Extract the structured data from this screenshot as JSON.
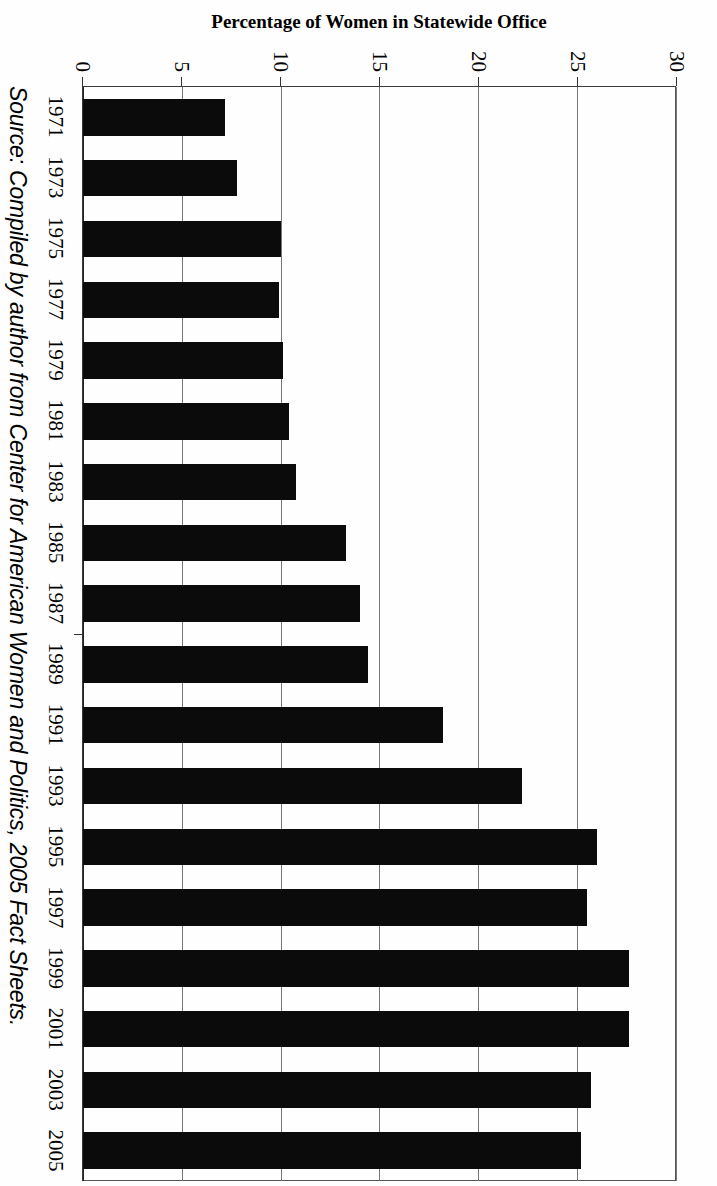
{
  "chart_data": {
    "type": "bar",
    "orientation": "vertical",
    "title": "",
    "xlabel": "",
    "ylabel": "Percentage of Women in Statewide Office",
    "ylim": [
      0,
      30
    ],
    "yticks": [
      0,
      5,
      10,
      15,
      20,
      25,
      30
    ],
    "ytick_labels": [
      "0",
      "5",
      "10",
      "15",
      "20",
      "25",
      "30"
    ],
    "grid": true,
    "legend": false,
    "categories": [
      "1971",
      "1973",
      "1975",
      "1977",
      "1979",
      "1981",
      "1983",
      "1985",
      "1987",
      "1989",
      "1991",
      "1993",
      "1995",
      "1997",
      "1999",
      "2001",
      "2003",
      "2005"
    ],
    "values": [
      7.2,
      7.8,
      10.0,
      9.9,
      10.1,
      10.4,
      10.8,
      13.3,
      14.0,
      14.4,
      18.2,
      22.2,
      26.0,
      25.5,
      27.6,
      27.6,
      25.7,
      25.2
    ],
    "bar_color": "#0b0b0b"
  },
  "axis": {
    "y_title": "Percentage of Women in Statewide Office",
    "tick_labels": [
      "30",
      "25",
      "20",
      "15",
      "10",
      "5",
      "0"
    ]
  },
  "source": {
    "caption": "Source: Compiled by author from Center for American Women and Politics, 2005 Fact Sheets."
  }
}
